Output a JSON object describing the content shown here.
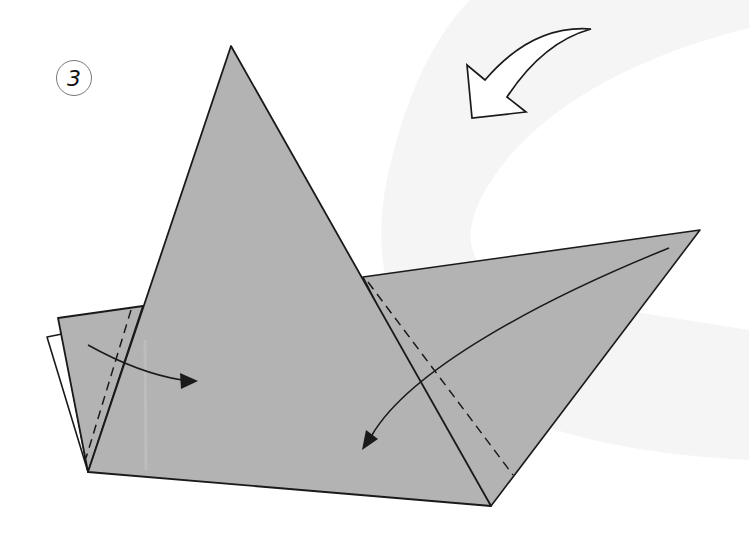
{
  "step": {
    "number": "3"
  },
  "colors": {
    "paper": "#b3b3b3",
    "paper_back": "#ffffff",
    "outline": "#1a1a1a",
    "background_swoosh": "#f5f5f5",
    "background": "#ffffff"
  },
  "shapes": {
    "main_triangle": {
      "apex": [
        231,
        46
      ],
      "bottom_left": [
        88,
        472
      ],
      "bottom_right": [
        491,
        506
      ]
    },
    "left_flap": {
      "points": [
        [
          58,
          318
        ],
        [
          143,
          306
        ],
        [
          88,
          472
        ]
      ]
    },
    "white_back_flap": {
      "points": [
        [
          47,
          337
        ],
        [
          60,
          334
        ],
        [
          88,
          472
        ]
      ]
    },
    "right_wing": {
      "points": [
        [
          363,
          277
        ],
        [
          700,
          230
        ],
        [
          491,
          506
        ]
      ]
    }
  },
  "fold_lines": [
    {
      "type": "valley-dashed",
      "from": [
        131,
        310
      ],
      "to": [
        86,
        458
      ]
    },
    {
      "type": "valley-dashed",
      "from": [
        366,
        281
      ],
      "to": [
        513,
        475
      ]
    }
  ],
  "arrows": [
    {
      "type": "fold-arrow",
      "direction": "left-flap-to-right",
      "from": [
        88,
        348
      ],
      "to": [
        198,
        380
      ]
    },
    {
      "type": "fold-arrow",
      "direction": "right-wing-to-left",
      "from": [
        669,
        248
      ],
      "to": [
        362,
        449
      ]
    },
    {
      "type": "turn-over-hollow-arrow",
      "direction": "down-left",
      "position": [
        468,
        28
      ]
    }
  ]
}
